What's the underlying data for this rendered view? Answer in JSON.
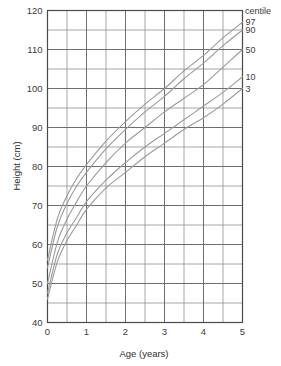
{
  "chart_data": {
    "type": "line",
    "title": "",
    "xlabel": "Age (years)",
    "ylabel": "Height (cm)",
    "xlim": [
      0,
      5
    ],
    "ylim": [
      40,
      120
    ],
    "grid": true,
    "x_major_ticks": [
      0,
      1,
      2,
      3,
      4,
      5
    ],
    "x_minor_step": 0.5,
    "y_major_ticks": [
      40,
      50,
      60,
      70,
      80,
      90,
      100,
      110,
      120
    ],
    "y_minor_step": 5,
    "x_tick_labels": [
      "0",
      "1",
      "2",
      "3",
      "4",
      "5"
    ],
    "y_tick_labels": [
      "40",
      "50",
      "60",
      "70",
      "80",
      "90",
      "100",
      "110",
      "120"
    ],
    "legend_position": "right-inline",
    "legend_title": "centile",
    "x": [
      0,
      0.25,
      0.5,
      0.75,
      1,
      1.5,
      2,
      2.5,
      3,
      3.5,
      4,
      4.5,
      5
    ],
    "series": [
      {
        "name": "97",
        "label": "97",
        "values": [
          56,
          66.5,
          72.5,
          77,
          80.5,
          86.5,
          91.5,
          96,
          100,
          104.5,
          108.5,
          113,
          117
        ],
        "end_value": 117
      },
      {
        "name": "90",
        "label": "90",
        "values": [
          54,
          64.5,
          70.5,
          75,
          78.5,
          84.5,
          89.5,
          94,
          98,
          102.5,
          106.5,
          111,
          115
        ],
        "end_value": 115
      },
      {
        "name": "50",
        "label": "50",
        "values": [
          50,
          60.5,
          66.5,
          71,
          75,
          81,
          86,
          90,
          94,
          97.5,
          101,
          105.5,
          110
        ],
        "end_value": 110
      },
      {
        "name": "10",
        "label": "10",
        "values": [
          47.5,
          57.5,
          63,
          67,
          71,
          76.5,
          81,
          85,
          88.5,
          92,
          95.5,
          99,
          103
        ],
        "end_value": 103
      },
      {
        "name": "3",
        "label": "3",
        "values": [
          46,
          55.5,
          61,
          65,
          69,
          74.5,
          78.5,
          82.5,
          86,
          89.5,
          92.5,
          96,
          100
        ],
        "end_value": 100
      }
    ]
  },
  "colors": {
    "curve": "#9a9a9a",
    "grid_major": "#6e6e6e",
    "grid_minor": "#8f8f8f",
    "axis": "#4a4a4a",
    "text": "#3d3d3d",
    "background": "#ffffff"
  }
}
